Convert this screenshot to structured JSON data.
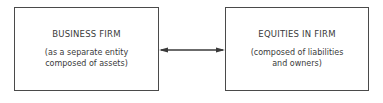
{
  "diagram": {
    "left_box": {
      "title": "BUSINESS FIRM",
      "description_line1": "(as a separate entity",
      "description_line2": "composed of assets)"
    },
    "right_box": {
      "title": "EQUITIES IN FIRM",
      "description_line1": "(composed of liabilities",
      "description_line2": "and owners)"
    },
    "connector": {
      "type": "bidirectional-arrow",
      "from": "left_box",
      "to": "right_box"
    },
    "colors": {
      "stroke": "#4a4a4a",
      "text": "#3a3a3a",
      "background": "#ffffff"
    }
  }
}
